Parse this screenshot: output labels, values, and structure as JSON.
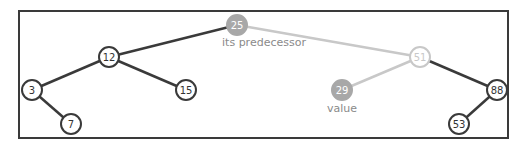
{
  "diagram": {
    "type": "binary-search-tree",
    "nodes": [
      {
        "id": "n25",
        "value": "25",
        "x": 237,
        "y": 25,
        "style": "filled",
        "label": "its predecessor"
      },
      {
        "id": "n12",
        "value": "12",
        "x": 109,
        "y": 57,
        "style": "normal"
      },
      {
        "id": "n3",
        "value": "3",
        "x": 32,
        "y": 90,
        "style": "normal"
      },
      {
        "id": "n7",
        "value": "7",
        "x": 71,
        "y": 124,
        "style": "normal"
      },
      {
        "id": "n15",
        "value": "15",
        "x": 186,
        "y": 90,
        "style": "normal"
      },
      {
        "id": "n51",
        "value": "51",
        "x": 420,
        "y": 57,
        "style": "faded"
      },
      {
        "id": "n29",
        "value": "29",
        "x": 342,
        "y": 90,
        "style": "filled",
        "label": "value"
      },
      {
        "id": "n88",
        "value": "88",
        "x": 497,
        "y": 90,
        "style": "normal"
      },
      {
        "id": "n53",
        "value": "53",
        "x": 459,
        "y": 124,
        "style": "normal"
      }
    ],
    "edges": [
      {
        "from": "n25",
        "to": "n12",
        "style": "dark"
      },
      {
        "from": "n25",
        "to": "n51",
        "style": "faded"
      },
      {
        "from": "n12",
        "to": "n3",
        "style": "dark"
      },
      {
        "from": "n12",
        "to": "n15",
        "style": "dark"
      },
      {
        "from": "n3",
        "to": "n7",
        "style": "dark"
      },
      {
        "from": "n51",
        "to": "n29",
        "style": "faded"
      },
      {
        "from": "n51",
        "to": "n88",
        "style": "dark"
      },
      {
        "from": "n88",
        "to": "n53",
        "style": "dark"
      }
    ],
    "labels": {
      "predecessor": "its predecessor",
      "value": "value"
    },
    "colors": {
      "dark": "#3a3a3a",
      "faded": "#c8c8c8",
      "filled": "#a8a8a8",
      "label": "#8a8a8a"
    }
  }
}
